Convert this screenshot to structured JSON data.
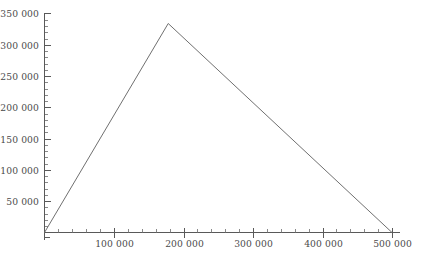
{
  "chart_data": {
    "type": "line",
    "title": "",
    "subtitle": "",
    "xlabel": "",
    "ylabel": "",
    "grid": false,
    "legend": false,
    "legend_position": "none",
    "xlim": [
      0,
      510000
    ],
    "ylim": [
      0,
      350000
    ],
    "x_major_tick_step": 100000,
    "x_minor_tick_step": 20000,
    "y_major_tick_step": 50000,
    "y_minor_tick_step": 10000,
    "x_tick_labels": [
      "100 000",
      "200 000",
      "300 000",
      "400 000",
      "500 000"
    ],
    "x_tick_values": [
      100000,
      200000,
      300000,
      400000,
      500000
    ],
    "y_tick_labels": [
      "50 000",
      "100 000",
      "150 000",
      "200 000",
      "250 000",
      "300 000",
      "350 000"
    ],
    "y_tick_values": [
      50000,
      100000,
      150000,
      200000,
      250000,
      300000,
      350000
    ],
    "series": [
      {
        "name": "series-1",
        "color": "#707070",
        "x": [
          0,
          178000,
          500000
        ],
        "y": [
          0,
          334000,
          0
        ]
      }
    ],
    "annotations": []
  },
  "axis_color": "#595959",
  "label_color": "#4a4a4a",
  "background_color": "#ffffff"
}
